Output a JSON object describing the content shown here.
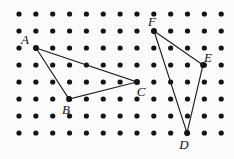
{
  "figure": {
    "background_color": "#fbfbfb",
    "dot_color": "#141414",
    "line_color": "#1a1a1a",
    "label_color": "#111111",
    "width": 234,
    "height": 159
  },
  "chart_data": {
    "type": "scatter",
    "xlabel": "",
    "ylabel": "",
    "grid": "dot-lattice",
    "legend": "none",
    "lattice": {
      "columns": 13,
      "rows": 8,
      "origin_x": 19,
      "origin_y": 14,
      "spacing_x": 16.85,
      "spacing_y": 17.0,
      "dot_radius": 2.6
    },
    "points": [
      {
        "label": "A",
        "col": 1,
        "row": 2,
        "x": 36,
        "y": 48,
        "label_dx": -11,
        "label_dy": -4
      },
      {
        "label": "B",
        "col": 3,
        "row": 5,
        "x": 69,
        "y": 99,
        "label_dx": -3,
        "label_dy": 15
      },
      {
        "label": "C",
        "col": 7,
        "row": 4,
        "x": 137,
        "y": 82,
        "label_dx": 4,
        "label_dy": 14
      },
      {
        "label": "D",
        "col": 10,
        "row": 7,
        "x": 187,
        "y": 133,
        "label_dx": -3,
        "label_dy": 16
      },
      {
        "label": "E",
        "col": 11,
        "row": 3,
        "x": 203,
        "y": 65,
        "label_dx": 5,
        "label_dy": -3
      },
      {
        "label": "F",
        "col": 8,
        "row": 1,
        "x": 154,
        "y": 31,
        "label_dx": -2,
        "label_dy": -5
      }
    ],
    "shapes": [
      {
        "name": "triangle-ABC",
        "vertices": [
          "A",
          "B",
          "C"
        ],
        "path": "36,48 69,99 137,82 36,48"
      },
      {
        "name": "triangle-DEF",
        "vertices": [
          "F",
          "E",
          "D"
        ],
        "path": "154,31 203,65 187,133 154,31"
      }
    ]
  }
}
